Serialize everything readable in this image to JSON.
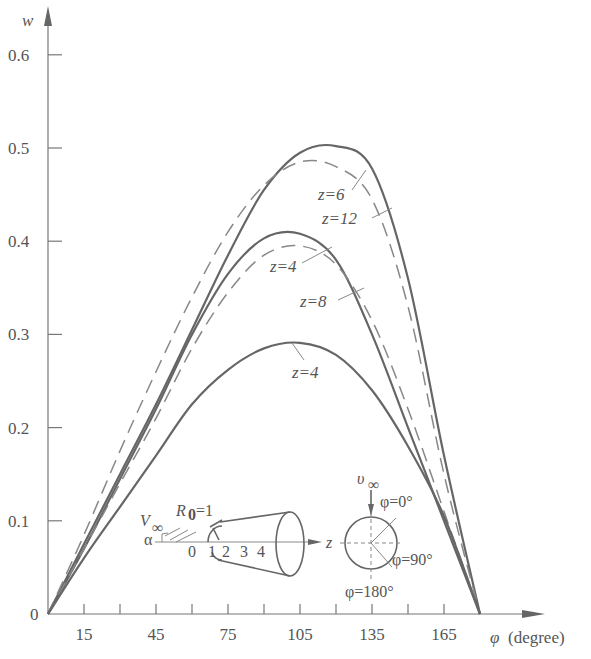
{
  "chart_data": {
    "type": "line",
    "title": "",
    "xlabel": "φ (degree)",
    "ylabel": "w",
    "xlim": [
      0,
      180
    ],
    "ylim": [
      0,
      0.6
    ],
    "grid": false,
    "x_ticks": [
      15,
      30,
      45,
      60,
      75,
      90,
      105,
      120,
      135,
      150,
      165
    ],
    "x_tick_labels": [
      "15",
      "45",
      "75",
      "105",
      "135",
      "165"
    ],
    "y_tick_labels": [
      "0",
      "0.1",
      "0.2",
      "0.3",
      "0.4",
      "0.5",
      "0.6"
    ],
    "x": [
      0,
      15,
      30,
      45,
      60,
      75,
      90,
      105,
      120,
      135,
      150,
      165,
      180
    ],
    "series": [
      {
        "name": "z=6",
        "style": "solid",
        "values": [
          0,
          0.075,
          0.15,
          0.225,
          0.305,
          0.385,
          0.455,
          0.495,
          0.502,
          0.478,
          0.36,
          0.17,
          0
        ]
      },
      {
        "name": "z=12",
        "style": "dashed",
        "values": [
          0,
          0.085,
          0.175,
          0.26,
          0.34,
          0.41,
          0.46,
          0.485,
          0.48,
          0.445,
          0.33,
          0.15,
          0
        ]
      },
      {
        "name": "z=4",
        "style": "solid",
        "values": [
          0,
          0.07,
          0.145,
          0.22,
          0.3,
          0.365,
          0.403,
          0.408,
          0.38,
          0.3,
          0.2,
          0.1,
          0
        ]
      },
      {
        "name": "z=8",
        "style": "dashed",
        "values": [
          0,
          0.07,
          0.14,
          0.21,
          0.285,
          0.345,
          0.385,
          0.395,
          0.375,
          0.315,
          0.22,
          0.11,
          0
        ]
      },
      {
        "name": "z=4 (lower)",
        "style": "solid",
        "values": [
          0,
          0.06,
          0.115,
          0.17,
          0.225,
          0.262,
          0.285,
          0.291,
          0.278,
          0.24,
          0.18,
          0.105,
          0
        ]
      }
    ],
    "annotations": [
      "z=6",
      "z=12",
      "z=4",
      "z=8",
      "z=4"
    ],
    "inset": {
      "labels": [
        "V∞",
        "α",
        "R₀=1",
        "0",
        "1",
        "2",
        "3",
        "4",
        "z",
        "v∞",
        "φ=0°",
        "φ=90°",
        "φ=180°"
      ]
    }
  },
  "labels": {
    "y_axis": "w",
    "x_axis_symbol": "φ",
    "x_axis_unit": "(degree)",
    "z6": "z=6",
    "z12": "z=12",
    "z4_mid": "z=4",
    "z8": "z=8",
    "z4_low": "z=4",
    "inset_vinf": "V",
    "inset_inf_sub": "∞",
    "inset_alpha": "α",
    "inset_r0": "R",
    "inset_r0_sub": "0",
    "inset_r0_val": "=1",
    "inset_z": "z",
    "inset_nums": [
      "0",
      "1",
      "2",
      "3",
      "4"
    ],
    "inset_v": "υ",
    "inset_phi0": "φ=0°",
    "inset_phi90": "φ=90°",
    "inset_phi180": "φ=180°"
  }
}
